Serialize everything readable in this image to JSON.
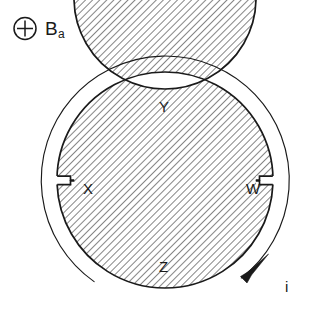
{
  "figure": {
    "background_color": "#ffffff",
    "ink_color": "#1a1a1a",
    "hatch_color": "#2b2b2b"
  },
  "field_annotation": {
    "icon": "circled-plus-icon",
    "symbol_glyph": "+",
    "base": "B",
    "subscript": "a",
    "meaning": "applied magnetic field directed into the page"
  },
  "ring": {
    "shape": "annulus",
    "center": {
      "x": 165,
      "y": 180
    },
    "outer_radius": 108,
    "inner_radius": 91,
    "fill": "hatched",
    "hatch_angle_deg": 45,
    "hatch_spacing_px": 5,
    "outline_color": "#1a1a1a",
    "outline_width_px": 1.6
  },
  "notches": [
    {
      "name": "notch-left",
      "label": "X",
      "angle_deg": 180,
      "position_side": "left",
      "gap_width_px": 9,
      "description": "small rectangular gap across the ring width"
    },
    {
      "name": "notch-right",
      "label": "W",
      "angle_deg": 0,
      "position_side": "right",
      "gap_width_px": 9,
      "description": "small rectangular gap across the ring width"
    }
  ],
  "point_labels": [
    {
      "name": "label-Y",
      "text": "Y",
      "location": "top inner edge"
    },
    {
      "name": "label-Z",
      "text": "Z",
      "location": "bottom inner edge"
    },
    {
      "name": "label-X",
      "text": "X",
      "location": "left notch"
    },
    {
      "name": "label-W",
      "text": "W",
      "location": "right notch"
    }
  ],
  "current_arc": {
    "name": "current-direction-arc",
    "label": "i",
    "radius": 124,
    "start_angle_deg": 125,
    "end_angle_deg": 308,
    "sweep": "counterclockwise",
    "arrow": "filled-triangle",
    "stroke_width_px": 1.1,
    "description": "thin outer arc ending in an arrowhead indicating current direction"
  }
}
